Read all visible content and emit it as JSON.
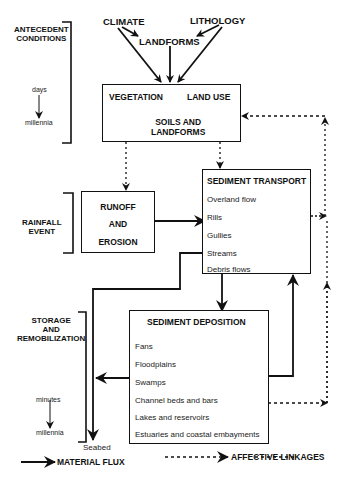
{
  "side_labels": {
    "antecedent": [
      "ANTECEDENT",
      "CONDITIONS"
    ],
    "antecedent_scale": {
      "from": "days",
      "to": "millennia"
    },
    "rainfall": [
      "RAINFALL",
      "EVENT"
    ],
    "storage": [
      "STORAGE",
      "AND",
      "REMOBILIZATION"
    ],
    "storage_scale": {
      "from": "minutes",
      "to": "millennia"
    }
  },
  "top_factors": {
    "climate": "CLIMATE",
    "lithology": "LITHOLOGY",
    "landforms": "LANDFORMS"
  },
  "landscape_box": {
    "vegetation": "VEGETATION",
    "land_use": "LAND USE",
    "soils": [
      "SOILS AND",
      "LANDFORMS"
    ]
  },
  "runoff_box": {
    "lines": [
      "RUNOFF",
      "AND",
      "EROSION"
    ]
  },
  "transport_box": {
    "title": "SEDIMENT TRANSPORT",
    "items": [
      "Overland flow",
      "Rills",
      "Gullies",
      "Streams",
      "Debris flows"
    ]
  },
  "deposition_box": {
    "title": "SEDIMENT DEPOSITION",
    "items": [
      "Fans",
      "Floodplains",
      "Swamps",
      "Channel beds and bars",
      "Lakes and reservoirs",
      "Estuaries and coastal embayments"
    ]
  },
  "seabed": "Seabed",
  "legend": {
    "material_flux": "MATERIAL FLUX",
    "affective_linkages": "AFFECTIVE LINKAGES"
  }
}
